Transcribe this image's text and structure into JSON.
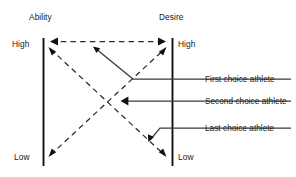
{
  "diagram": {
    "title_left": "Ability",
    "title_right": "Desire",
    "scale_left": {
      "high": "High",
      "low": "Low"
    },
    "scale_right": {
      "high": "High",
      "low": "Low"
    },
    "annotations": [
      {
        "id": "first",
        "label": "First choice athlete"
      },
      {
        "id": "second",
        "label": "Second choice athlete"
      },
      {
        "id": "last",
        "label": "Last choice athlete"
      }
    ],
    "colors": {
      "ink": "#111111",
      "dash": "#2b2b2b",
      "leader": "#3a3a3a",
      "background": "#ffffff"
    }
  }
}
